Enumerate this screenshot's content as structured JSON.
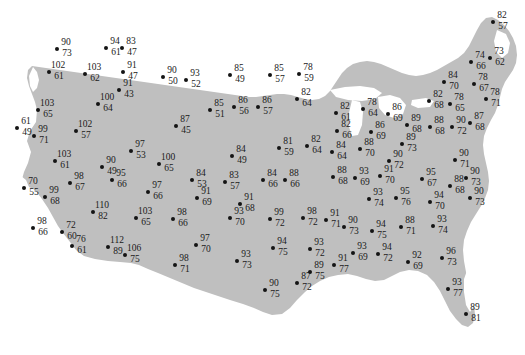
{
  "figure": {
    "type": "map-scatter",
    "basemap": "united-states-contiguous",
    "land_color": "#bfbfbf",
    "ocean_color": "#ffffff",
    "lake_color": "#ffffff",
    "point_color": "#141414",
    "label_color": "#1a1a1a",
    "title": "",
    "legend": "",
    "axis_labels": "",
    "note": "Each station is marked by a filled dot with two stacked numbers: an upper value and a lower value."
  },
  "chart_data": {
    "type": "scatter",
    "title": "",
    "xlabel": "",
    "ylabel": "",
    "grid": false,
    "legend_position": "none",
    "value_fields": [
      "upper",
      "lower"
    ],
    "points": [
      {
        "upper": 90,
        "lower": 73,
        "x": 57,
        "y": 49
      },
      {
        "upper": 94,
        "lower": 61,
        "x": 106,
        "y": 48
      },
      {
        "upper": 83,
        "lower": 47,
        "x": 122,
        "y": 48
      },
      {
        "upper": 102,
        "lower": 61,
        "x": 49,
        "y": 72
      },
      {
        "upper": 103,
        "lower": 62,
        "x": 85,
        "y": 74
      },
      {
        "upper": 91,
        "lower": 47,
        "x": 123,
        "y": 72
      },
      {
        "upper": 90,
        "lower": 50,
        "x": 163,
        "y": 77
      },
      {
        "upper": 91,
        "lower": 43,
        "x": 119,
        "y": 90
      },
      {
        "upper": 100,
        "lower": 64,
        "x": 98,
        "y": 104
      },
      {
        "upper": 103,
        "lower": 65,
        "x": 38,
        "y": 110
      },
      {
        "upper": 61,
        "lower": 49,
        "x": 17,
        "y": 128
      },
      {
        "upper": 99,
        "lower": 71,
        "x": 34,
        "y": 136
      },
      {
        "upper": 102,
        "lower": 57,
        "x": 76,
        "y": 131
      },
      {
        "upper": 93,
        "lower": 52,
        "x": 186,
        "y": 80
      },
      {
        "upper": 85,
        "lower": 49,
        "x": 230,
        "y": 75
      },
      {
        "upper": 85,
        "lower": 57,
        "x": 270,
        "y": 75
      },
      {
        "upper": 78,
        "lower": 59,
        "x": 299,
        "y": 74
      },
      {
        "upper": 82,
        "lower": 64,
        "x": 297,
        "y": 99
      },
      {
        "upper": 85,
        "lower": 51,
        "x": 210,
        "y": 110
      },
      {
        "upper": 86,
        "lower": 56,
        "x": 234,
        "y": 107
      },
      {
        "upper": 86,
        "lower": 57,
        "x": 258,
        "y": 107
      },
      {
        "upper": 87,
        "lower": 45,
        "x": 176,
        "y": 126
      },
      {
        "upper": 97,
        "lower": 53,
        "x": 131,
        "y": 151
      },
      {
        "upper": 103,
        "lower": 61,
        "x": 55,
        "y": 161
      },
      {
        "upper": 90,
        "lower": 49,
        "x": 102,
        "y": 167
      },
      {
        "upper": 100,
        "lower": 65,
        "x": 159,
        "y": 164
      },
      {
        "upper": 84,
        "lower": 49,
        "x": 232,
        "y": 156
      },
      {
        "upper": 81,
        "lower": 59,
        "x": 279,
        "y": 148
      },
      {
        "upper": 82,
        "lower": 64,
        "x": 307,
        "y": 146
      },
      {
        "upper": 70,
        "lower": 55,
        "x": 24,
        "y": 188
      },
      {
        "upper": 95,
        "lower": 66,
        "x": 112,
        "y": 180
      },
      {
        "upper": 99,
        "lower": 68,
        "x": 45,
        "y": 197
      },
      {
        "upper": 98,
        "lower": 67,
        "x": 70,
        "y": 183
      },
      {
        "upper": 97,
        "lower": 66,
        "x": 148,
        "y": 192
      },
      {
        "upper": 84,
        "lower": 53,
        "x": 192,
        "y": 180
      },
      {
        "upper": 83,
        "lower": 57,
        "x": 225,
        "y": 182
      },
      {
        "upper": 91,
        "lower": 69,
        "x": 197,
        "y": 198
      },
      {
        "upper": 91,
        "lower": 68,
        "x": 240,
        "y": 204
      },
      {
        "upper": 84,
        "lower": 66,
        "x": 263,
        "y": 180
      },
      {
        "upper": 88,
        "lower": 66,
        "x": 285,
        "y": 180
      },
      {
        "upper": 110,
        "lower": 82,
        "x": 93,
        "y": 212
      },
      {
        "upper": 103,
        "lower": 65,
        "x": 136,
        "y": 218
      },
      {
        "upper": 98,
        "lower": 66,
        "x": 173,
        "y": 219
      },
      {
        "upper": 98,
        "lower": 66,
        "x": 33,
        "y": 228
      },
      {
        "upper": 72,
        "lower": 60,
        "x": 62,
        "y": 232
      },
      {
        "upper": 76,
        "lower": 61,
        "x": 72,
        "y": 246
      },
      {
        "upper": 112,
        "lower": 89,
        "x": 108,
        "y": 247
      },
      {
        "upper": 106,
        "lower": 75,
        "x": 125,
        "y": 255
      },
      {
        "upper": 97,
        "lower": 70,
        "x": 196,
        "y": 245
      },
      {
        "upper": 98,
        "lower": 71,
        "x": 175,
        "y": 265
      },
      {
        "upper": 93,
        "lower": 70,
        "x": 230,
        "y": 218
      },
      {
        "upper": 93,
        "lower": 73,
        "x": 237,
        "y": 261
      },
      {
        "upper": 99,
        "lower": 72,
        "x": 270,
        "y": 219
      },
      {
        "upper": 98,
        "lower": 72,
        "x": 303,
        "y": 218
      },
      {
        "upper": 91,
        "lower": 71,
        "x": 326,
        "y": 220
      },
      {
        "upper": 94,
        "lower": 75,
        "x": 273,
        "y": 248
      },
      {
        "upper": 93,
        "lower": 72,
        "x": 310,
        "y": 249
      },
      {
        "upper": 90,
        "lower": 75,
        "x": 265,
        "y": 290
      },
      {
        "upper": 87,
        "lower": 72,
        "x": 297,
        "y": 283
      },
      {
        "upper": 82,
        "lower": 61,
        "x": 336,
        "y": 113
      },
      {
        "upper": 78,
        "lower": 64,
        "x": 363,
        "y": 109
      },
      {
        "upper": 86,
        "lower": 69,
        "x": 388,
        "y": 114
      },
      {
        "upper": 82,
        "lower": 68,
        "x": 429,
        "y": 101
      },
      {
        "upper": 78,
        "lower": 65,
        "x": 450,
        "y": 104
      },
      {
        "upper": 78,
        "lower": 71,
        "x": 486,
        "y": 99
      },
      {
        "upper": 82,
        "lower": 66,
        "x": 337,
        "y": 131
      },
      {
        "upper": 86,
        "lower": 69,
        "x": 371,
        "y": 132
      },
      {
        "upper": 89,
        "lower": 68,
        "x": 407,
        "y": 125
      },
      {
        "upper": 88,
        "lower": 68,
        "x": 430,
        "y": 127
      },
      {
        "upper": 90,
        "lower": 72,
        "x": 452,
        "y": 127
      },
      {
        "upper": 87,
        "lower": 68,
        "x": 470,
        "y": 123
      },
      {
        "upper": 84,
        "lower": 64,
        "x": 332,
        "y": 152
      },
      {
        "upper": 88,
        "lower": 70,
        "x": 360,
        "y": 149
      },
      {
        "upper": 89,
        "lower": 73,
        "x": 402,
        "y": 144
      },
      {
        "upper": 90,
        "lower": 72,
        "x": 389,
        "y": 161
      },
      {
        "upper": 90,
        "lower": 71,
        "x": 455,
        "y": 160
      },
      {
        "upper": 88,
        "lower": 68,
        "x": 333,
        "y": 177
      },
      {
        "upper": 93,
        "lower": 69,
        "x": 355,
        "y": 178
      },
      {
        "upper": 91,
        "lower": 70,
        "x": 380,
        "y": 176
      },
      {
        "upper": 95,
        "lower": 67,
        "x": 422,
        "y": 179
      },
      {
        "upper": 88,
        "lower": 68,
        "x": 450,
        "y": 186
      },
      {
        "upper": 90,
        "lower": 73,
        "x": 466,
        "y": 178
      },
      {
        "upper": 93,
        "lower": 74,
        "x": 369,
        "y": 199
      },
      {
        "upper": 95,
        "lower": 76,
        "x": 396,
        "y": 198
      },
      {
        "upper": 94,
        "lower": 70,
        "x": 430,
        "y": 202
      },
      {
        "upper": 90,
        "lower": 73,
        "x": 470,
        "y": 198
      },
      {
        "upper": 90,
        "lower": 73,
        "x": 344,
        "y": 227
      },
      {
        "upper": 94,
        "lower": 75,
        "x": 372,
        "y": 231
      },
      {
        "upper": 88,
        "lower": 71,
        "x": 401,
        "y": 227
      },
      {
        "upper": 93,
        "lower": 74,
        "x": 433,
        "y": 226
      },
      {
        "upper": 93,
        "lower": 69,
        "x": 353,
        "y": 253
      },
      {
        "upper": 94,
        "lower": 72,
        "x": 378,
        "y": 254
      },
      {
        "upper": 92,
        "lower": 69,
        "x": 408,
        "y": 262
      },
      {
        "upper": 96,
        "lower": 73,
        "x": 442,
        "y": 258
      },
      {
        "upper": 91,
        "lower": 77,
        "x": 334,
        "y": 265
      },
      {
        "upper": 89,
        "lower": 75,
        "x": 310,
        "y": 272
      },
      {
        "upper": 93,
        "lower": 77,
        "x": 448,
        "y": 289
      },
      {
        "upper": 89,
        "lower": 81,
        "x": 466,
        "y": 314
      },
      {
        "upper": 82,
        "lower": 57,
        "x": 493,
        "y": 22
      },
      {
        "upper": 73,
        "lower": 62,
        "x": 490,
        "y": 58
      },
      {
        "upper": 74,
        "lower": 66,
        "x": 471,
        "y": 62
      },
      {
        "upper": 84,
        "lower": 70,
        "x": 444,
        "y": 82
      },
      {
        "upper": 78,
        "lower": 67,
        "x": 474,
        "y": 84
      }
    ]
  }
}
